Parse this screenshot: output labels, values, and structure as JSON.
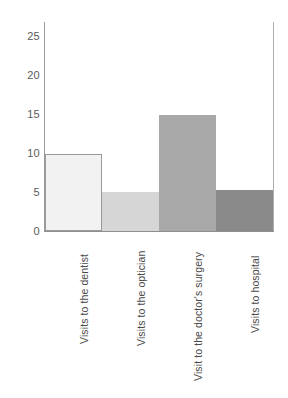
{
  "chart_data": {
    "type": "bar",
    "title": "",
    "subtitle": "",
    "xlabel": "",
    "ylabel": "",
    "categories": [
      "Visits to the dentist",
      "Visits to the optician",
      "Visit to the doctor's surgery",
      "Visits to hospital"
    ],
    "values": [
      10,
      5,
      15,
      5.3
    ],
    "bar_colors": [
      "#f2f2f2",
      "#d6d6d6",
      "#a8a8a8",
      "#8a8a8a"
    ],
    "ylim": [
      0,
      27
    ],
    "yticks": [
      0,
      5,
      10,
      15,
      20,
      25
    ],
    "ytick_labels": [
      "0",
      "5",
      "10",
      "15",
      "20",
      "25"
    ],
    "grid": false,
    "legend": false,
    "legend_position": "none",
    "bars_contiguous": true,
    "x_tick_label_rotation": -90,
    "axis_color": "#9a9a9a",
    "text_color": "#4a4a4a",
    "background": "#ffffff"
  }
}
